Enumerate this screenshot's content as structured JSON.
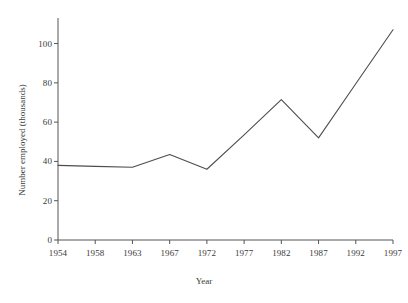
{
  "chart_data": {
    "type": "line",
    "title": "",
    "xlabel": "Year",
    "ylabel": "Number employed (thousands)",
    "categories": [
      "1954",
      "1958",
      "1963",
      "1967",
      "1972",
      "1977",
      "1982",
      "1987",
      "1992",
      "1997"
    ],
    "x": [
      1954,
      1958,
      1963,
      1967,
      1972,
      1977,
      1982,
      1987,
      1992,
      1997
    ],
    "values": [
      38,
      37.5,
      37,
      43.5,
      36,
      53.5,
      71.5,
      52,
      79.5,
      107
    ],
    "series": [
      {
        "name": "Number employed",
        "values": [
          38,
          37.5,
          37,
          43.5,
          36,
          53.5,
          71.5,
          52,
          79.5,
          107
        ]
      }
    ],
    "xtick_labels": [
      "1954",
      "1958",
      "1963",
      "1967",
      "1972",
      "1977",
      "1982",
      "1987",
      "1992",
      "1997"
    ],
    "ytick_labels": [
      "0",
      "20",
      "40",
      "60",
      "80",
      "100"
    ],
    "yticks": [
      0,
      20,
      40,
      60,
      80,
      100
    ],
    "ylim": [
      0,
      113
    ],
    "grid": false,
    "legend": false,
    "line_color": "#4d4d4d",
    "axis_color": "#555555",
    "background_color": "#ffffff"
  }
}
